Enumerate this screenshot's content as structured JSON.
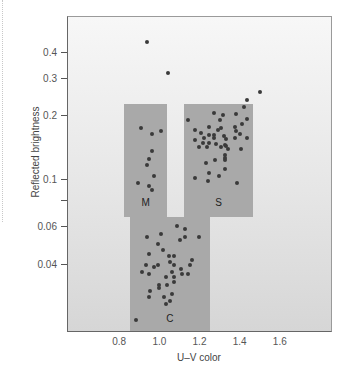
{
  "chart_data": {
    "type": "scatter",
    "title": "",
    "xlabel": "U–V color",
    "ylabel": "Reflected brightness",
    "xscale": "linear",
    "yscale": "log",
    "xlim": [
      0.54,
      1.86
    ],
    "ylim": [
      0.019,
      0.59
    ],
    "grid": false,
    "x_ticks": [
      0.8,
      1.0,
      1.2,
      1.4,
      1.6
    ],
    "x_tick_labels": [
      "0.8",
      "1.0",
      "1.2",
      "1.4",
      "1.6"
    ],
    "y_ticks": [
      0.04,
      0.06,
      0.08,
      0.1,
      0.2,
      0.3,
      0.4
    ],
    "y_tick_labels": [
      "0.04",
      "0.06",
      "",
      "0.1",
      "0.2",
      "0.3",
      "0.4"
    ],
    "regions": [
      {
        "name": "M",
        "x_range": [
          0.82,
          1.035
        ],
        "y_range": [
          0.067,
          0.23
        ],
        "color": "#a9a9a9"
      },
      {
        "name": "S",
        "x_range": [
          1.12,
          1.46
        ],
        "y_range": [
          0.067,
          0.23
        ],
        "color": "#a9a9a9"
      },
      {
        "name": "C",
        "x_range": [
          0.85,
          1.245
        ],
        "y_range": [
          0.019,
          0.067
        ],
        "color": "#a9a9a9"
      }
    ],
    "series": [
      {
        "name": "Outliers",
        "points": [
          [
            0.934,
            0.45
          ],
          [
            1.037,
            0.32
          ],
          [
            1.494,
            0.26
          ]
        ]
      },
      {
        "name": "M",
        "points": [
          [
            0.905,
            0.176
          ],
          [
            0.958,
            0.165
          ],
          [
            1.005,
            0.171
          ],
          [
            0.958,
            0.137
          ],
          [
            0.941,
            0.126
          ],
          [
            0.933,
            0.118
          ],
          [
            0.97,
            0.105
          ],
          [
            0.887,
            0.097
          ],
          [
            0.943,
            0.094
          ],
          [
            0.958,
            0.09
          ]
        ]
      },
      {
        "name": "S",
        "points": [
          [
            1.434,
            0.24
          ],
          [
            1.418,
            0.222
          ],
          [
            1.14,
            0.193
          ],
          [
            1.267,
            0.208
          ],
          [
            1.311,
            0.203
          ],
          [
            1.299,
            0.192
          ],
          [
            1.378,
            0.205
          ],
          [
            1.434,
            0.194
          ],
          [
            1.408,
            0.185
          ],
          [
            1.171,
            0.173
          ],
          [
            1.241,
            0.179
          ],
          [
            1.288,
            0.173
          ],
          [
            1.301,
            0.177
          ],
          [
            1.37,
            0.179
          ],
          [
            1.378,
            0.17
          ],
          [
            1.201,
            0.168
          ],
          [
            1.241,
            0.163
          ],
          [
            1.267,
            0.163
          ],
          [
            1.316,
            0.162
          ],
          [
            1.395,
            0.165
          ],
          [
            1.218,
            0.158
          ],
          [
            1.171,
            0.155
          ],
          [
            1.267,
            0.158
          ],
          [
            1.329,
            0.157
          ],
          [
            1.37,
            0.159
          ],
          [
            1.434,
            0.159
          ],
          [
            1.213,
            0.15
          ],
          [
            1.241,
            0.15
          ],
          [
            1.279,
            0.148
          ],
          [
            1.324,
            0.146
          ],
          [
            1.191,
            0.144
          ],
          [
            1.234,
            0.143
          ],
          [
            1.301,
            0.143
          ],
          [
            1.329,
            0.145
          ],
          [
            1.337,
            0.14
          ],
          [
            1.4,
            0.14
          ],
          [
            1.32,
            0.131
          ],
          [
            1.32,
            0.127
          ],
          [
            1.32,
            0.125
          ],
          [
            1.271,
            0.125
          ],
          [
            1.226,
            0.121
          ],
          [
            1.32,
            0.113
          ],
          [
            1.243,
            0.108
          ],
          [
            1.293,
            0.105
          ],
          [
            1.171,
            0.103
          ],
          [
            1.238,
            0.099
          ],
          [
            1.38,
            0.097
          ]
        ]
      },
      {
        "name": "C",
        "points": [
          [
            1.083,
            0.061
          ],
          [
            1.125,
            0.059
          ],
          [
            0.935,
            0.054
          ],
          [
            1.005,
            0.056
          ],
          [
            1.1,
            0.052
          ],
          [
            1.125,
            0.054
          ],
          [
            1.193,
            0.054
          ],
          [
            0.988,
            0.05
          ],
          [
            1.013,
            0.047
          ],
          [
            0.943,
            0.045
          ],
          [
            1.043,
            0.044
          ],
          [
            1.068,
            0.044
          ],
          [
            1.158,
            0.042
          ],
          [
            1.05,
            0.041
          ],
          [
            0.93,
            0.04
          ],
          [
            0.966,
            0.039
          ],
          [
            0.988,
            0.04
          ],
          [
            1.068,
            0.04
          ],
          [
            1.15,
            0.04
          ],
          [
            1.101,
            0.038
          ],
          [
            0.908,
            0.037
          ],
          [
            0.943,
            0.036
          ],
          [
            1.06,
            0.037
          ],
          [
            1.11,
            0.036
          ],
          [
            1.138,
            0.036
          ],
          [
            1.03,
            0.035
          ],
          [
            1.068,
            0.035
          ],
          [
            0.993,
            0.032
          ],
          [
            0.993,
            0.031
          ],
          [
            1.033,
            0.032
          ],
          [
            1.068,
            0.033
          ],
          [
            0.946,
            0.03
          ],
          [
            1.058,
            0.029
          ],
          [
            0.943,
            0.028
          ],
          [
            1.016,
            0.028
          ],
          [
            1.046,
            0.027
          ],
          [
            1.03,
            0.026
          ],
          [
            0.88,
            0.022
          ]
        ]
      }
    ],
    "annotations": [
      "M",
      "S",
      "C"
    ],
    "legend": null
  },
  "axis": {
    "x_title": "U–V color",
    "y_title": "Reflected brightness"
  },
  "colors": {
    "region": "#a9a9a9",
    "point": "#3a3a3a",
    "axis": "#555555"
  }
}
